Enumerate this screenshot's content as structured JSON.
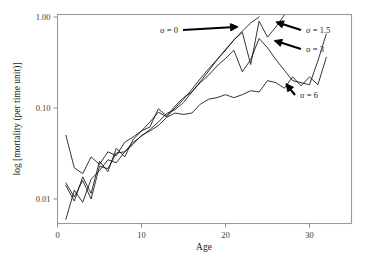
{
  "chart_data": {
    "type": "line",
    "title": "",
    "xlabel": "Age",
    "ylabel": "log [mortality (per time unit)]",
    "xlim": [
      0,
      35
    ],
    "ylim": [
      0.005,
      1.15
    ],
    "yscale": "log",
    "grid": false,
    "legend_position": "inline-annotations",
    "xticks": [
      0,
      10,
      20,
      30
    ],
    "xtick_labels": [
      "0",
      "10",
      "20",
      "30"
    ],
    "yticks": [
      0.01,
      0.1,
      1.0
    ],
    "ytick_labels": [
      "0.01",
      "0.10",
      "1.00"
    ],
    "annotations": [
      {
        "text": "σ = 0",
        "target_x": 21.5,
        "target_y": 0.78
      },
      {
        "text": "σ = 1.5",
        "target_x": 26.0,
        "target_y": 0.88
      },
      {
        "text": "σ = 3",
        "target_x": 25.8,
        "target_y": 0.55
      },
      {
        "text": "σ = 6",
        "target_x": 27.2,
        "target_y": 0.185
      }
    ],
    "series": [
      {
        "name": "σ = 0",
        "label": "σ = 0",
        "color": "#111111",
        "x": [
          1,
          2,
          3,
          4,
          5,
          6,
          7,
          8,
          9,
          10,
          11,
          12,
          13,
          14,
          15,
          16,
          17,
          18,
          19,
          20,
          21,
          22,
          23,
          24
        ],
        "y": [
          0.006,
          0.0125,
          0.0092,
          0.0165,
          0.0205,
          0.027,
          0.025,
          0.033,
          0.042,
          0.049,
          0.058,
          0.07,
          0.087,
          0.096,
          0.115,
          0.15,
          0.195,
          0.255,
          0.34,
          0.43,
          0.56,
          0.7,
          0.86,
          1.0
        ]
      },
      {
        "name": "σ = 1.5",
        "label": "σ = 1.5",
        "color": "#111111",
        "x": [
          1,
          2,
          3,
          4,
          5,
          6,
          7,
          8,
          9,
          10,
          11,
          12,
          13,
          14,
          15,
          16,
          17,
          18,
          19,
          20,
          21,
          22,
          23,
          24,
          25,
          26,
          27
        ],
        "y": [
          0.05,
          0.022,
          0.019,
          0.029,
          0.024,
          0.033,
          0.03,
          0.042,
          0.048,
          0.056,
          0.07,
          0.09,
          0.08,
          0.1,
          0.125,
          0.16,
          0.21,
          0.27,
          0.34,
          0.44,
          0.56,
          0.68,
          0.3,
          0.9,
          0.6,
          0.78,
          1.05
        ]
      },
      {
        "name": "σ = 3",
        "label": "σ = 3",
        "color": "#111111",
        "x": [
          1,
          2,
          3,
          4,
          5,
          6,
          7,
          8,
          9,
          10,
          11,
          12,
          13,
          14,
          15,
          16,
          17,
          18,
          19,
          20,
          21,
          22,
          23,
          24,
          25,
          26,
          27,
          28,
          29,
          30,
          31,
          32
        ],
        "y": [
          0.014,
          0.0095,
          0.0175,
          0.0115,
          0.026,
          0.02,
          0.036,
          0.029,
          0.045,
          0.056,
          0.062,
          0.098,
          0.082,
          0.105,
          0.13,
          0.15,
          0.19,
          0.23,
          0.29,
          0.35,
          0.43,
          0.25,
          0.34,
          0.58,
          0.46,
          0.34,
          0.26,
          0.2,
          0.19,
          0.18,
          0.33,
          0.65
        ]
      },
      {
        "name": "σ = 6",
        "label": "σ = 6",
        "color": "#111111",
        "x": [
          1,
          2,
          3,
          4,
          5,
          6,
          7,
          8,
          9,
          10,
          11,
          12,
          13,
          14,
          15,
          16,
          17,
          18,
          19,
          20,
          21,
          22,
          23,
          24,
          25,
          26,
          27,
          28,
          29,
          30,
          31,
          32
        ],
        "y": [
          0.015,
          0.0105,
          0.016,
          0.01,
          0.023,
          0.0215,
          0.032,
          0.033,
          0.04,
          0.05,
          0.056,
          0.064,
          0.079,
          0.088,
          0.085,
          0.088,
          0.11,
          0.125,
          0.13,
          0.14,
          0.13,
          0.14,
          0.155,
          0.15,
          0.2,
          0.19,
          0.165,
          0.22,
          0.175,
          0.22,
          0.18,
          0.36
        ]
      }
    ]
  }
}
